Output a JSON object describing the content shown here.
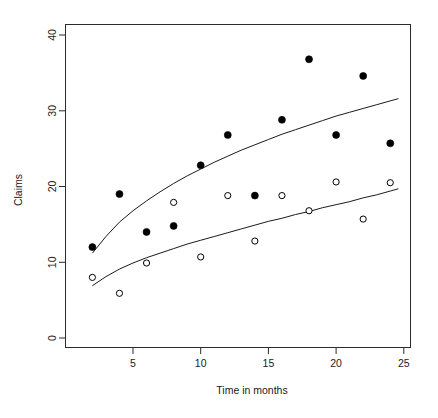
{
  "chart_data": {
    "type": "scatter",
    "title": "",
    "xlabel": "Time in months",
    "ylabel": "Claims",
    "xlim": [
      1.2,
      25.8
    ],
    "ylim": [
      -1.5,
      41.5
    ],
    "xticks": [
      5,
      10,
      15,
      20,
      25
    ],
    "yticks": [
      0,
      10,
      20,
      30,
      40
    ],
    "xtick_labels": [
      "5",
      "10",
      "15",
      "20",
      "25"
    ],
    "ytick_labels": [
      "0",
      "10",
      "20",
      "30",
      "40"
    ],
    "grid": false,
    "legend": "none",
    "x": [
      2,
      4,
      6,
      8,
      10,
      12,
      14,
      16,
      18,
      20,
      22,
      24
    ],
    "series": [
      {
        "name": "filled-circles",
        "marker": "filled-circle",
        "color": "#000000",
        "values": [
          12.0,
          19.0,
          14.0,
          14.8,
          22.8,
          26.8,
          18.8,
          28.8,
          36.8,
          26.8,
          34.6,
          25.7
        ]
      },
      {
        "name": "open-circles",
        "marker": "open-circle",
        "color": "#000000",
        "values": [
          8.0,
          5.9,
          9.9,
          17.9,
          10.7,
          18.8,
          12.8,
          18.8,
          16.8,
          20.6,
          15.7,
          20.5
        ]
      }
    ],
    "fitted_curves": [
      {
        "name": "upper-fitted-curve",
        "x": [
          2.0,
          3.0,
          4.0,
          5.0,
          6.0,
          7.0,
          8.0,
          9.0,
          10.0,
          11.0,
          12.0,
          13.0,
          14.0,
          15.0,
          16.0,
          17.0,
          18.0,
          19.0,
          20.0,
          21.0,
          22.0,
          23.0,
          24.0,
          24.6
        ],
        "y": [
          11.2,
          13.4,
          15.3,
          16.8,
          18.1,
          19.3,
          20.4,
          21.4,
          22.3,
          23.2,
          24.0,
          24.8,
          25.5,
          26.2,
          26.9,
          27.5,
          28.1,
          28.7,
          29.3,
          29.8,
          30.3,
          30.8,
          31.3,
          31.6
        ]
      },
      {
        "name": "lower-fitted-curve",
        "x": [
          2.0,
          3.0,
          4.0,
          5.0,
          6.0,
          7.0,
          8.0,
          9.0,
          10.0,
          11.0,
          12.0,
          13.0,
          14.0,
          15.0,
          16.0,
          17.0,
          18.0,
          19.0,
          20.0,
          21.0,
          22.0,
          23.0,
          24.0,
          24.6
        ],
        "y": [
          6.9,
          8.1,
          9.1,
          9.9,
          10.6,
          11.2,
          11.8,
          12.4,
          12.9,
          13.4,
          13.9,
          14.4,
          14.9,
          15.4,
          15.8,
          16.3,
          16.7,
          17.2,
          17.6,
          18.0,
          18.5,
          18.9,
          19.4,
          19.7
        ]
      }
    ]
  },
  "axes": {
    "x_title": "Time in months",
    "y_title": "Claims"
  }
}
